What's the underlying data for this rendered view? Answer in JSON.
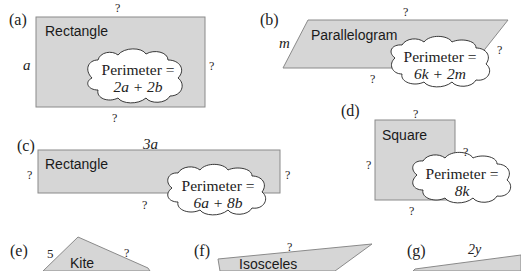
{
  "colors": {
    "shape_fill": "#d6d6d6",
    "shape_stroke": "#8a8a8a",
    "text": "#222222",
    "cloud_fill": "#ffffff"
  },
  "problems": [
    {
      "label": "(a)",
      "shape": "Rectangle",
      "sides": {
        "top": "?",
        "left": "a",
        "right": "?",
        "bottom": "?"
      },
      "perimeter_label": "Perimeter =",
      "perimeter_expr": "2a + 2b"
    },
    {
      "label": "(b)",
      "shape": "Parallelogram",
      "sides": {
        "top": "?",
        "left": "m",
        "right": "?",
        "bottom": "?"
      },
      "perimeter_label": "Perimeter =",
      "perimeter_expr": "6k + 2m"
    },
    {
      "label": "(c)",
      "shape": "Rectangle",
      "sides": {
        "top": "3a",
        "left": "?",
        "right": "?",
        "bottom": "?"
      },
      "perimeter_label": "Perimeter =",
      "perimeter_expr": "6a + 8b"
    },
    {
      "label": "(d)",
      "shape": "Square",
      "sides": {
        "top": "?",
        "left": "?",
        "right": "?",
        "bottom": "?"
      },
      "perimeter_label": "Perimeter =",
      "perimeter_expr": "8k"
    },
    {
      "label": "(e)",
      "shape": "Kite",
      "sides": {
        "upper_left": "5",
        "upper_right": "?"
      }
    },
    {
      "label": "(f)",
      "shape": "Isosceles",
      "sides": {
        "top": "?"
      }
    },
    {
      "label": "(g)",
      "shape": "",
      "sides": {
        "top": "2y"
      }
    }
  ]
}
